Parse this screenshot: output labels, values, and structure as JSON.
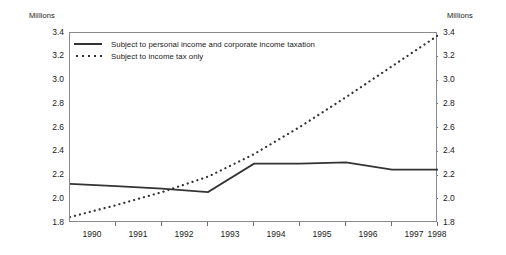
{
  "chart_data": {
    "type": "line",
    "title": "",
    "xlabel": "",
    "ylabel": "Millions",
    "ylabel_right": "Millions",
    "ylim": [
      1.8,
      3.4
    ],
    "yticks": [
      "3.4",
      "3.2",
      "3.0",
      "2.8",
      "2.6",
      "2.4",
      "2.2",
      "2.0",
      "1.8"
    ],
    "ytick_values": [
      3.4,
      3.2,
      3.0,
      2.8,
      2.6,
      2.4,
      2.2,
      2.0,
      1.8
    ],
    "categories": [
      "1990",
      "1991",
      "1992",
      "1993",
      "1994",
      "1995",
      "1996",
      "1997",
      "1998"
    ],
    "x": [
      1990,
      1991,
      1992,
      1993,
      1994,
      1995,
      1996,
      1997,
      1998
    ],
    "grid": false,
    "legend_position": "top-left",
    "series": [
      {
        "name": "Subject to personal income and corporate income taxation",
        "style": "solid",
        "color": "#333333",
        "values": [
          2.13,
          2.11,
          2.09,
          2.06,
          2.3,
          2.3,
          2.31,
          2.25,
          2.25
        ]
      },
      {
        "name": "Subject to income tax only",
        "style": "dotted",
        "color": "#333333",
        "values": [
          1.85,
          1.95,
          2.06,
          2.19,
          2.38,
          2.61,
          2.86,
          3.12,
          3.38
        ]
      }
    ]
  },
  "axes": {
    "left_title": "Millions",
    "right_title": "Millions"
  },
  "colors": {
    "series_line": "#333333",
    "axis": "#8a8a8a",
    "text": "#1a1a1a",
    "background": "#ffffff"
  }
}
